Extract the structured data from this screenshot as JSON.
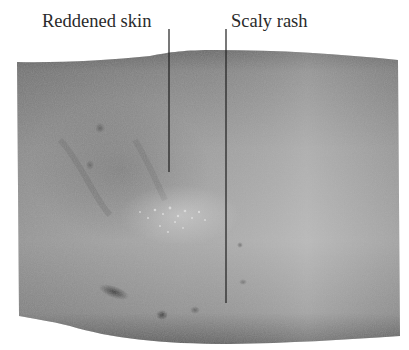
{
  "figure": {
    "background_color": "#ffffff",
    "skin_tone_light": "#bdbdbd",
    "skin_tone_dark": "#6e6e6e",
    "leader_line_color": "#1e1e1e"
  },
  "annotations": [
    {
      "label": "Reddened skin",
      "line_x": 169,
      "line_top": 29,
      "line_bottom": 172
    },
    {
      "label": "Scaly rash",
      "line_x": 226,
      "line_top": 29,
      "line_bottom": 303
    }
  ]
}
